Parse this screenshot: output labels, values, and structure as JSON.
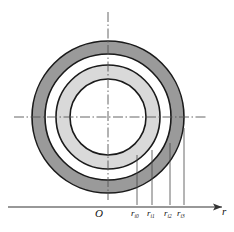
{
  "figure": {
    "origin_label": "O",
    "axis_label": "r",
    "colors": {
      "outer_ring_fill": "#9a9a9a",
      "middle_ring_fill": "#d9d9d9",
      "core_fill": "#ffffff",
      "gap_fill": "#ffffff",
      "outline": "#1a1a1a",
      "centerline": "#555555",
      "leader_line": "#444444",
      "axis": "#333333",
      "background": "#ffffff"
    },
    "center": {
      "x": 108,
      "y": 117
    },
    "rings": [
      {
        "name": "core",
        "radius": 38,
        "fill": "#ffffff"
      },
      {
        "name": "middle-ring",
        "radius": 52,
        "fill": "#d9d9d9"
      },
      {
        "name": "gap-ring",
        "radius": 63,
        "fill": "#ffffff"
      },
      {
        "name": "outer-ring",
        "radius": 76,
        "fill": "#9a9a9a"
      }
    ],
    "axis": {
      "y": 207,
      "x_start": 8,
      "x_end": 226,
      "arrow": true
    },
    "ticks": [
      {
        "id": "ri0",
        "label": "r",
        "subscript": "i0",
        "x": 137,
        "radius": 38
      },
      {
        "id": "ri1",
        "label": "r",
        "subscript": "i1",
        "x": 152,
        "radius": 52
      },
      {
        "id": "ri2",
        "label": "r",
        "subscript": "i2",
        "x": 170,
        "radius": 63
      },
      {
        "id": "ri3",
        "label": "r",
        "subscript": "i3",
        "x": 184,
        "radius": 76
      }
    ],
    "centerlines": {
      "horizontal": {
        "y": 117,
        "x_start": 14,
        "x_end": 206
      },
      "vertical": {
        "x": 108,
        "y_start": 12,
        "y_end": 200
      }
    }
  }
}
